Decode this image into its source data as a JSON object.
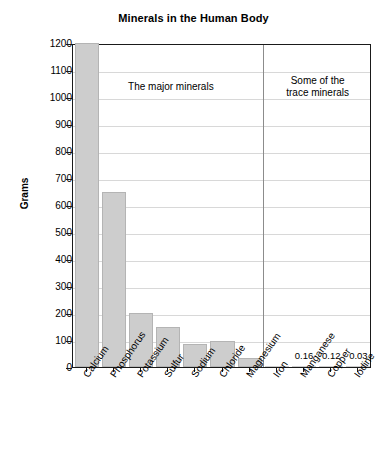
{
  "chart_data": {
    "type": "bar",
    "title": "Minerals in the Human Body",
    "xlabel": "",
    "ylabel": "Grams",
    "ylim": [
      0,
      1200
    ],
    "ytick_step": 100,
    "yticks": [
      1200,
      1100,
      1000,
      900,
      800,
      700,
      600,
      500,
      400,
      300,
      200,
      100,
      0
    ],
    "grid": true,
    "legend": "none",
    "categories": [
      "Calcium",
      "Phosphorus",
      "Potassium",
      "Sulfur",
      "Sodium",
      "Chloride",
      "Magnesium",
      "Iron",
      "Manganese",
      "Copper",
      "Iodine"
    ],
    "values": [
      1200,
      650,
      200,
      150,
      85,
      95,
      35,
      4.2,
      0.16,
      0.12,
      0.03
    ],
    "data_labels": [
      "",
      "",
      "",
      "",
      "",
      "",
      "",
      "",
      "0.16",
      "0.12",
      "0.03"
    ],
    "annotations": [
      {
        "text": "The major minerals",
        "group": "major"
      },
      {
        "text": "Some of the\ntrace minerals",
        "group": "trace"
      }
    ],
    "colors": {
      "bar_fill": "#cdcdcd",
      "bar_border": "#b4b4b4",
      "axis": "#1a1a1a",
      "gridline": "#d8d8d8",
      "divider": "#8c8c8c",
      "background": "#ffffff",
      "text": "#000000"
    }
  }
}
